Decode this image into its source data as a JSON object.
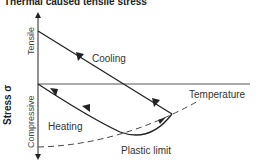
{
  "title": "Thermal caused tensile stress",
  "axes": {
    "y_label": "Stress σ",
    "y_top": "Tensile",
    "y_bottom": "Compressive"
  },
  "labels": {
    "cooling": "Cooling",
    "heating": "Heating",
    "temperature": "Temperature",
    "plastic_limit": "Plastic limit"
  }
}
